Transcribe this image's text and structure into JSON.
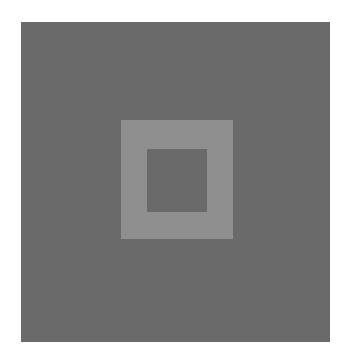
{
  "figure": {
    "colors": {
      "background": "#6a6a6a",
      "frame": "#8f8f8f",
      "inner": "#6a6a6a",
      "page": "#ffffff"
    }
  }
}
